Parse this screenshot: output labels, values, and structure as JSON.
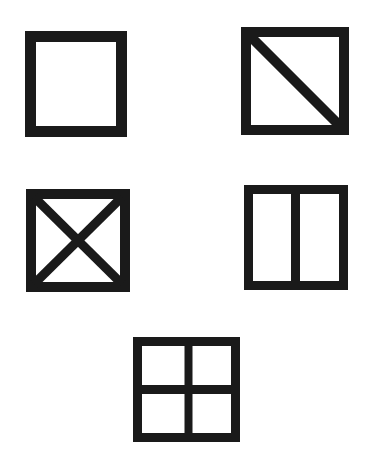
{
  "diagram": {
    "background": "#ffffff",
    "ink": "#1a1a1a",
    "figures": [
      {
        "id": "square-plain",
        "x": 25,
        "y": 31,
        "w": 102,
        "h": 106,
        "stroke": 11,
        "division": "none"
      },
      {
        "id": "square-diagonal",
        "x": 241,
        "y": 27,
        "w": 108,
        "h": 108,
        "stroke": 10,
        "division": "diagonal-tl-br"
      },
      {
        "id": "square-cross-diagonals",
        "x": 26,
        "y": 189,
        "w": 104,
        "h": 103,
        "stroke": 10,
        "division": "both-diagonals"
      },
      {
        "id": "square-vertical-split",
        "x": 244,
        "y": 185,
        "w": 104,
        "h": 105,
        "stroke": 9,
        "division": "vertical-halves"
      },
      {
        "id": "square-quadrants",
        "x": 133,
        "y": 337,
        "w": 107,
        "h": 105,
        "stroke": 9,
        "division": "quadrants"
      }
    ]
  }
}
